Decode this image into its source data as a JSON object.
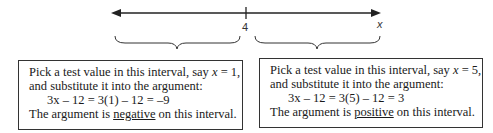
{
  "number_line": {
    "point_label": "4",
    "axis_label": "x"
  },
  "left_box": {
    "line1_prefix": "Pick a test value in this interval, say ",
    "var": "x",
    "line1_suffix": " = 1,",
    "line2": "and substitute it into the argument:",
    "equation": "3x – 12 = 3(1) – 12 = –9",
    "line4_prefix": "The argument is ",
    "sign_word": "negative",
    "line4_suffix": " on this interval."
  },
  "right_box": {
    "line1_prefix": "Pick a test value in this interval, say ",
    "var": "x",
    "line1_suffix": " = 5,",
    "line2": "and substitute it into the argument:",
    "equation": "3x – 12 = 3(5) – 12 = 3",
    "line4_prefix": "The argument is ",
    "sign_word": "positive",
    "line4_suffix": " on this interval."
  }
}
